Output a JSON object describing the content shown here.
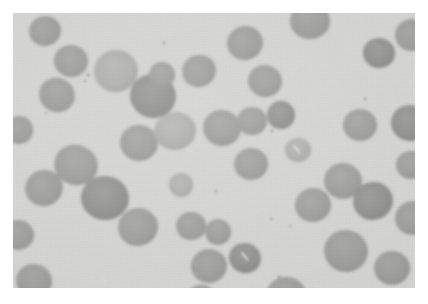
{
  "figure": {
    "kind": "photomicrograph",
    "plate": {
      "background_color": "#d4d4d2",
      "cell_color": "#9b9b99",
      "cell_shade_dark": "#8e8e8c",
      "cell_shade_light": "#adadab",
      "inclusion_color": "#d9d9d7",
      "width_px": 402,
      "height_px": 275,
      "left_px": 13,
      "top_px": 13
    },
    "caption": {
      "label": "",
      "text": "",
      "visible": false,
      "note": "caption line is cropped at the bottom page edge and not legible"
    }
  },
  "micrograph_cells": [
    {
      "cx": 32,
      "cy": 18,
      "rx": 16,
      "ry": 15,
      "tone": "mid",
      "rot": -14
    },
    {
      "cx": 58,
      "cy": 48,
      "rx": 17,
      "ry": 16,
      "tone": "mid",
      "rot": 8
    },
    {
      "cx": 44,
      "cy": 82,
      "rx": 18,
      "ry": 17,
      "tone": "mid",
      "rot": 22
    },
    {
      "cx": 103,
      "cy": 58,
      "rx": 22,
      "ry": 21,
      "tone": "light",
      "rot": -6
    },
    {
      "cx": 140,
      "cy": 83,
      "rx": 23,
      "ry": 22,
      "tone": "dark",
      "rot": 12
    },
    {
      "cx": 149,
      "cy": 62,
      "rx": 13,
      "ry": 13,
      "tone": "mid",
      "rot": 0
    },
    {
      "cx": 186,
      "cy": 58,
      "rx": 17,
      "ry": 16,
      "tone": "mid",
      "rot": -18
    },
    {
      "cx": 126,
      "cy": 130,
      "rx": 19,
      "ry": 18,
      "tone": "mid",
      "rot": 5
    },
    {
      "cx": 162,
      "cy": 118,
      "rx": 21,
      "ry": 19,
      "tone": "light",
      "rot": -9
    },
    {
      "cx": 209,
      "cy": 115,
      "rx": 19,
      "ry": 18,
      "tone": "mid",
      "rot": 14
    },
    {
      "cx": 239,
      "cy": 108,
      "rx": 15,
      "ry": 14,
      "tone": "mid",
      "rot": 0
    },
    {
      "cx": 268,
      "cy": 102,
      "rx": 14,
      "ry": 14,
      "tone": "dark",
      "rot": -5
    },
    {
      "cx": 252,
      "cy": 68,
      "rx": 17,
      "ry": 16,
      "tone": "mid",
      "rot": 10
    },
    {
      "cx": 232,
      "cy": 30,
      "rx": 18,
      "ry": 17,
      "tone": "mid",
      "rot": -11
    },
    {
      "cx": 297,
      "cy": 8,
      "rx": 20,
      "ry": 18,
      "tone": "mid",
      "rot": 0
    },
    {
      "cx": 366,
      "cy": 40,
      "rx": 16,
      "ry": 15,
      "tone": "dark",
      "rot": 7
    },
    {
      "cx": 399,
      "cy": 22,
      "rx": 17,
      "ry": 16,
      "tone": "mid",
      "rot": -8
    },
    {
      "cx": 63,
      "cy": 152,
      "rx": 22,
      "ry": 20,
      "tone": "mid",
      "rot": 18
    },
    {
      "cx": 31,
      "cy": 175,
      "rx": 19,
      "ry": 18,
      "tone": "mid",
      "rot": -20
    },
    {
      "cx": 92,
      "cy": 185,
      "rx": 24,
      "ry": 22,
      "tone": "dark",
      "rot": 4
    },
    {
      "cx": 125,
      "cy": 214,
      "rx": 20,
      "ry": 19,
      "tone": "mid",
      "rot": -12
    },
    {
      "cx": 178,
      "cy": 213,
      "rx": 15,
      "ry": 14,
      "tone": "mid",
      "rot": 0
    },
    {
      "cx": 205,
      "cy": 219,
      "rx": 13,
      "ry": 13,
      "tone": "mid",
      "rot": 9
    },
    {
      "cx": 196,
      "cy": 253,
      "rx": 18,
      "ry": 17,
      "tone": "mid",
      "rot": -6
    },
    {
      "cx": 232,
      "cy": 245,
      "rx": 16,
      "ry": 15,
      "tone": "dark",
      "rot": 15
    },
    {
      "cx": 300,
      "cy": 192,
      "rx": 18,
      "ry": 17,
      "tone": "mid",
      "rot": -10
    },
    {
      "cx": 330,
      "cy": 168,
      "rx": 19,
      "ry": 18,
      "tone": "mid",
      "rot": 6
    },
    {
      "cx": 360,
      "cy": 188,
      "rx": 20,
      "ry": 19,
      "tone": "dark",
      "rot": -15
    },
    {
      "cx": 333,
      "cy": 238,
      "rx": 22,
      "ry": 21,
      "tone": "mid",
      "rot": 11
    },
    {
      "cx": 379,
      "cy": 255,
      "rx": 18,
      "ry": 17,
      "tone": "mid",
      "rot": 0
    },
    {
      "cx": 273,
      "cy": 282,
      "rx": 20,
      "ry": 18,
      "tone": "mid",
      "rot": -7
    },
    {
      "cx": 188,
      "cy": 287,
      "rx": 16,
      "ry": 15,
      "tone": "mid",
      "rot": 0
    },
    {
      "cx": 21,
      "cy": 268,
      "rx": 18,
      "ry": 17,
      "tone": "mid",
      "rot": 13
    },
    {
      "cx": 238,
      "cy": 151,
      "rx": 17,
      "ry": 16,
      "tone": "mid",
      "rot": -4
    },
    {
      "cx": 285,
      "cy": 137,
      "rx": 13,
      "ry": 12,
      "tone": "light",
      "rot": 0
    },
    {
      "cx": 397,
      "cy": 110,
      "rx": 19,
      "ry": 18,
      "tone": "dark",
      "rot": 8
    },
    {
      "cx": 398,
      "cy": 152,
      "rx": 15,
      "ry": 14,
      "tone": "mid",
      "rot": 0
    },
    {
      "cx": 400,
      "cy": 205,
      "rx": 18,
      "ry": 17,
      "tone": "mid",
      "rot": -9
    },
    {
      "cx": 347,
      "cy": 112,
      "rx": 17,
      "ry": 16,
      "tone": "mid",
      "rot": 0
    },
    {
      "cx": 168,
      "cy": 172,
      "rx": 12,
      "ry": 12,
      "tone": "light",
      "rot": 0
    },
    {
      "cx": 6,
      "cy": 117,
      "rx": 14,
      "ry": 14,
      "tone": "mid",
      "rot": 0
    },
    {
      "cx": 5,
      "cy": 222,
      "rx": 16,
      "ry": 15,
      "tone": "mid",
      "rot": 0
    }
  ],
  "micrograph_inclusions": [
    {
      "cx": 233,
      "cy": 244,
      "kind": "crescent-pallor"
    },
    {
      "cx": 92,
      "cy": 268,
      "kind": "crescent-pallor"
    },
    {
      "cx": 285,
      "cy": 137,
      "kind": "crescent-pallor"
    }
  ],
  "micrograph_debris": [
    {
      "cx": 75,
      "cy": 62,
      "r": 1.6
    },
    {
      "cx": 72,
      "cy": 68,
      "r": 1.2
    },
    {
      "cx": 151,
      "cy": 30,
      "r": 1.3
    },
    {
      "cx": 259,
      "cy": 118,
      "r": 1.4
    },
    {
      "cx": 266,
      "cy": 264,
      "r": 1.5
    },
    {
      "cx": 258,
      "cy": 206,
      "r": 1.2
    },
    {
      "cx": 277,
      "cy": 213,
      "r": 1.1
    },
    {
      "cx": 203,
      "cy": 178,
      "r": 1.2
    },
    {
      "cx": 33,
      "cy": 100,
      "r": 1.1
    },
    {
      "cx": 352,
      "cy": 86,
      "r": 1.3
    }
  ]
}
